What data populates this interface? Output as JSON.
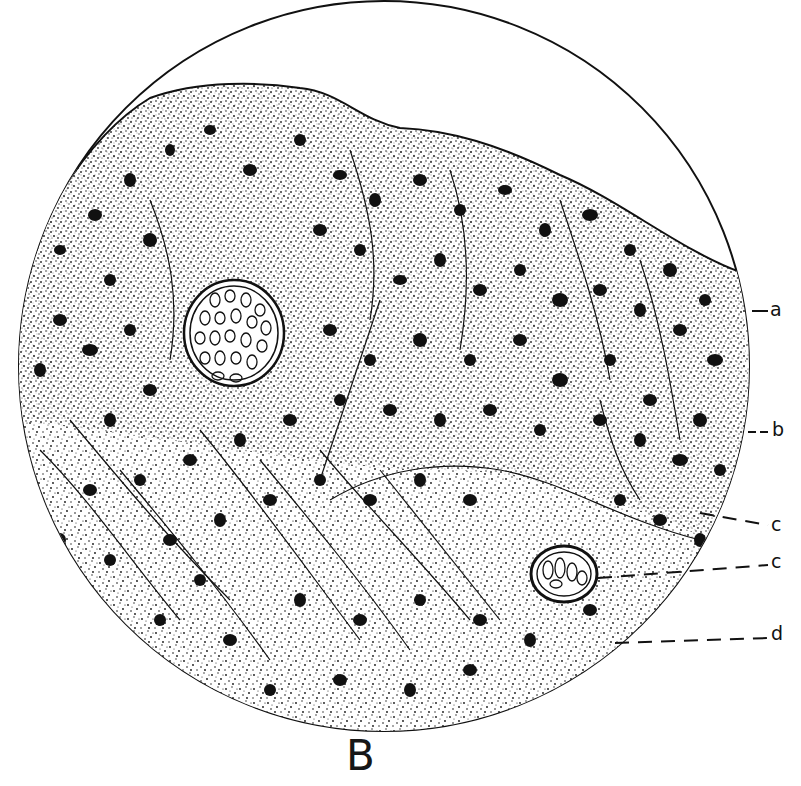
{
  "figure": {
    "caption": "B",
    "type": "histological section drawing (microscope field of view)",
    "colors": {
      "ink": "#111111",
      "paper": "#ffffff"
    },
    "field": {
      "cx": 384,
      "cy": 366,
      "r": 366
    },
    "labels": [
      {
        "id": "a",
        "text": "a",
        "x": 778,
        "y": 311,
        "leader": "solid"
      },
      {
        "id": "b",
        "text": "b",
        "x": 776,
        "y": 432,
        "leader": "dashed"
      },
      {
        "id": "c1",
        "text": "c",
        "x": 775,
        "y": 525,
        "leader": "dashed"
      },
      {
        "id": "c2",
        "text": "c",
        "x": 775,
        "y": 562,
        "leader": "dashed"
      },
      {
        "id": "d",
        "text": "d",
        "x": 775,
        "y": 632,
        "leader": "dashed"
      }
    ],
    "structures": [
      {
        "name": "large-bundle",
        "cx": 234,
        "cy": 333,
        "rx": 50,
        "ry": 52
      },
      {
        "name": "small-bundle",
        "cx": 564,
        "cy": 574,
        "rx": 33,
        "ry": 28
      }
    ]
  }
}
